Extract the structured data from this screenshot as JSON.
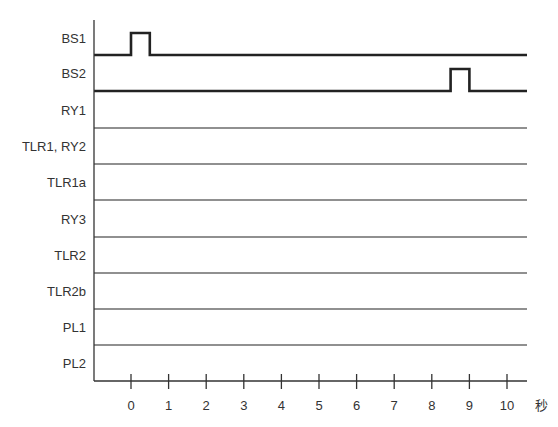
{
  "diagram": {
    "type": "timing-chart",
    "rows": [
      {
        "label": "BS1",
        "baseline_y": 55,
        "thick": true,
        "pulse": {
          "start": 0,
          "end": 0.5
        }
      },
      {
        "label": "BS2",
        "baseline_y": 91,
        "thick": true,
        "pulse": {
          "start": 8.5,
          "end": 9
        }
      },
      {
        "label": "RY1",
        "baseline_y": 128,
        "thick": false
      },
      {
        "label": "TLR1, RY2",
        "baseline_y": 164,
        "thick": false
      },
      {
        "label": "TLR1a",
        "baseline_y": 200,
        "thick": false
      },
      {
        "label": "RY3",
        "baseline_y": 237,
        "thick": false
      },
      {
        "label": "TLR2",
        "baseline_y": 273,
        "thick": false
      },
      {
        "label": "TLR2b",
        "baseline_y": 309,
        "thick": false
      },
      {
        "label": "PL1",
        "baseline_y": 345,
        "thick": false
      },
      {
        "label": "PL2",
        "baseline_y": 381,
        "thick": false
      }
    ],
    "x_axis": {
      "ticks": [
        "0",
        "1",
        "2",
        "3",
        "4",
        "5",
        "6",
        "7",
        "8",
        "9",
        "10"
      ],
      "unit": "秒"
    }
  }
}
